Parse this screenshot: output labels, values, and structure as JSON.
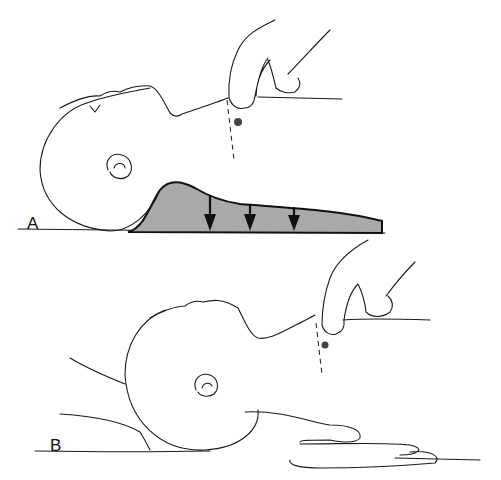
{
  "figure": {
    "panels": [
      {
        "id": "A",
        "label": "A",
        "description": "Infant supine on thick padding under shoulders; arrows show downward compression of padding; fingers palpating brachial/carotid pulse at neck"
      },
      {
        "id": "B",
        "label": "B",
        "description": "Infant supine with rescuer's hand supporting shoulders/back; fingers palpating pulse at neck"
      }
    ],
    "colors": {
      "ink": "#1a1a1a",
      "padding_fill": "#a9a9a9",
      "background": "#ffffff"
    },
    "arrows_count": 3
  }
}
